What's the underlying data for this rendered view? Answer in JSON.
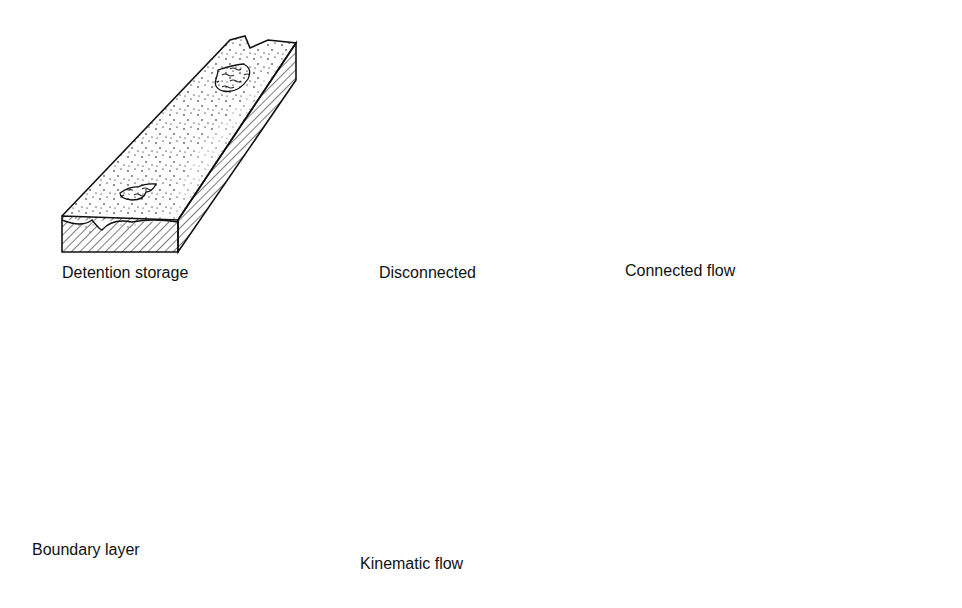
{
  "figure": {
    "panels": [
      {
        "id": "detention-storage",
        "label": "Detention storage"
      },
      {
        "id": "disconnected",
        "label": "Disconnected"
      },
      {
        "id": "connected-flow",
        "label": "Connected flow"
      },
      {
        "id": "boundary-layer",
        "label": "Boundary layer"
      },
      {
        "id": "kinematic-flow",
        "label": "Kinematic flow"
      }
    ],
    "legend_semantics": {
      "stipple": "soil surface",
      "hatching": "soil cross-section",
      "dashes": "surface water"
    }
  }
}
